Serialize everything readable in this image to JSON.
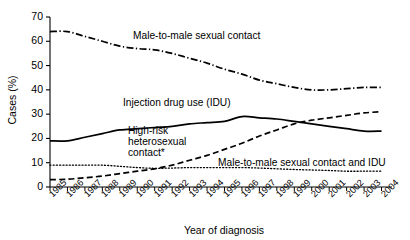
{
  "chart_data": {
    "type": "line",
    "title": "",
    "xlabel": "Year of diagnosis",
    "ylabel": "Cases (%)",
    "ylim": [
      0,
      70
    ],
    "ytick_step": 10,
    "yticks": [
      "0",
      "10",
      "20",
      "30",
      "40",
      "50",
      "60",
      "70"
    ],
    "grid": false,
    "legend_position": "inline-annotations",
    "x": [
      "1985",
      "1986",
      "1987",
      "1988",
      "1989",
      "1990",
      "1991",
      "1992",
      "1993",
      "1994",
      "1995",
      "1996",
      "1997",
      "1998",
      "1999",
      "2000",
      "2001",
      "2002",
      "2003",
      "2004"
    ],
    "series": [
      {
        "name": "Male-to-male sexual contact",
        "style": "dash-dot",
        "values": [
          64,
          64,
          62,
          60,
          58,
          57,
          56.5,
          55,
          53,
          51,
          48.5,
          46.5,
          44,
          42.5,
          41,
          40,
          40,
          40.5,
          41,
          41
        ]
      },
      {
        "name": "Injection drug use (IDU)",
        "style": "solid",
        "values": [
          19,
          19,
          20.5,
          22,
          23.5,
          24,
          24.5,
          25,
          26,
          26.5,
          27,
          29,
          28.5,
          28,
          27,
          26,
          25,
          24,
          23,
          23
        ]
      },
      {
        "name": "High-risk heterosexual contact*",
        "style": "dashed",
        "values": [
          3,
          3.2,
          3.8,
          4.5,
          5.5,
          6.5,
          7.5,
          9,
          11,
          13,
          15.5,
          18,
          21,
          23.5,
          26,
          27.5,
          28.5,
          29.5,
          30.5,
          31
        ]
      },
      {
        "name": "Male-to-male sexual contact and IDU",
        "style": "dotted",
        "values": [
          9,
          9,
          9,
          9,
          8.5,
          8,
          7.7,
          7.8,
          8,
          8,
          8,
          8,
          7.8,
          7.5,
          7.2,
          7,
          6.8,
          6.5,
          6.5,
          6.5
        ]
      }
    ],
    "annotations": [
      {
        "id": "ann-mmsc",
        "text": "Male-to-male sexual contact"
      },
      {
        "id": "ann-idu",
        "text": "Injection drug use (IDU)"
      },
      {
        "id": "ann-hrhc-line1",
        "text": "High-risk"
      },
      {
        "id": "ann-hrhc-line2",
        "text": "heterosexual"
      },
      {
        "id": "ann-hrhc-line3",
        "text": "contact*"
      },
      {
        "id": "ann-mmsc-idu",
        "text": "Male-to-male sexual contact and IDU"
      }
    ]
  },
  "colors": {
    "line": "#000000",
    "axis": "#000000",
    "background": "#ffffff"
  }
}
